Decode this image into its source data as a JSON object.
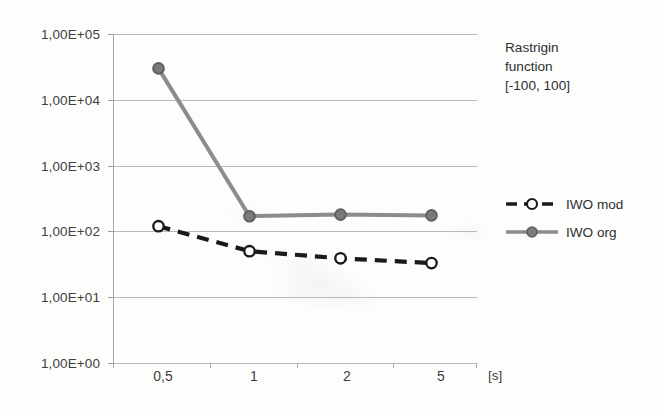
{
  "chart_data": {
    "type": "line",
    "title": "Rastrigin function [-100, 100]",
    "title_lines": [
      "Rastrigin",
      "function",
      "[-100, 100]"
    ],
    "xlabel": "[s]",
    "ylabel": "",
    "categories": [
      "0,5",
      "1",
      "2",
      "5"
    ],
    "x_values": [
      0.5,
      1,
      2,
      5
    ],
    "yscale": "log",
    "ylim": [
      1,
      100000
    ],
    "ytick_labels": [
      "1,00E+05",
      "1,00E+04",
      "1,00E+03",
      "1,00E+02",
      "1,00E+01",
      "1,00E+00"
    ],
    "ytick_values": [
      100000,
      10000,
      1000,
      100,
      10,
      1
    ],
    "grid": true,
    "legend_position": "right",
    "series": [
      {
        "name": "IWO mod",
        "values": [
          120,
          50,
          39,
          33
        ],
        "color": "#1a1a1a",
        "line_style": "dashed",
        "marker": "open-circle",
        "marker_fill": "#ffffff"
      },
      {
        "name": "IWO org",
        "values": [
          30000,
          170,
          180,
          175
        ],
        "color": "#8c8c8c",
        "line_style": "solid",
        "marker": "filled-circle",
        "marker_fill": "#7a7a7a"
      }
    ]
  },
  "colors": {
    "background": "#fdfdfc",
    "grid": "#b9b9b9",
    "axis": "#a8a8a8",
    "text": "#3f3f3f",
    "series_mod": "#1a1a1a",
    "series_org": "#8c8c8c"
  }
}
